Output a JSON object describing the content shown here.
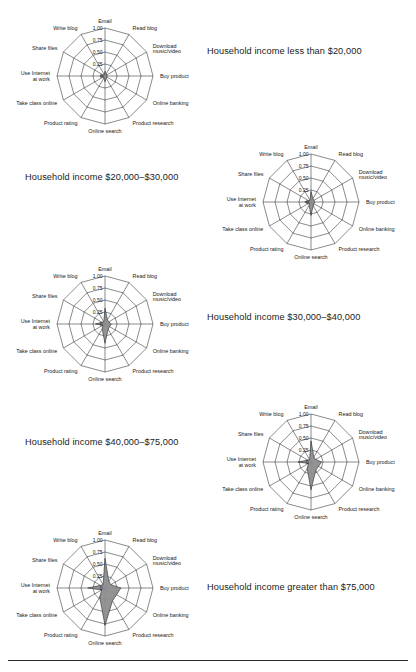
{
  "figure": {
    "title": "",
    "axes_labels": [
      "Email",
      "Read blog",
      "Download music/video",
      "Buy product",
      "Online banking",
      "Product research",
      "Online search",
      "Product rating",
      "Take class online",
      "Use Internet at work",
      "Share files",
      "Write blog"
    ],
    "tick_labels": [
      "1.00",
      "0.75",
      "0.50",
      "0.25",
      "0"
    ],
    "fill_color": "#8e8e8e",
    "line_color": "#2b2b2b",
    "panels": [
      {
        "caption": "Household income less than $20,000",
        "caption_side": "right",
        "values": [
          0.1,
          0.05,
          0.04,
          0.05,
          0.04,
          0.05,
          0.12,
          0.05,
          0.03,
          0.1,
          0.04,
          0.03
        ]
      },
      {
        "caption": "Household income $20,000–$30,000",
        "caption_side": "left",
        "values": [
          0.22,
          0.08,
          0.07,
          0.08,
          0.07,
          0.09,
          0.28,
          0.08,
          0.04,
          0.13,
          0.05,
          0.04
        ]
      },
      {
        "caption": "Household income $30,000–$40,000",
        "caption_side": "right",
        "values": [
          0.33,
          0.1,
          0.09,
          0.13,
          0.11,
          0.13,
          0.4,
          0.12,
          0.05,
          0.2,
          0.07,
          0.05
        ]
      },
      {
        "caption": "Household income $40,000–$75,000",
        "caption_side": "left",
        "values": [
          0.44,
          0.12,
          0.11,
          0.22,
          0.18,
          0.2,
          0.58,
          0.16,
          0.06,
          0.27,
          0.08,
          0.06
        ]
      },
      {
        "caption": "Household income greater than $75,000",
        "caption_side": "right",
        "values": [
          0.62,
          0.16,
          0.14,
          0.33,
          0.28,
          0.31,
          0.78,
          0.22,
          0.08,
          0.36,
          0.11,
          0.08
        ]
      }
    ]
  },
  "chart_data": {
    "type": "radar",
    "categories": [
      "Email",
      "Read blog",
      "Download music/video",
      "Buy product",
      "Online banking",
      "Product research",
      "Online search",
      "Product rating",
      "Take class online",
      "Use Internet at work",
      "Share files",
      "Write blog"
    ],
    "rlim": [
      0,
      1.0
    ],
    "rticks": [
      0,
      0.25,
      0.5,
      0.75,
      1.0
    ],
    "rtick_labels": [
      "0",
      "0.25",
      "0.50",
      "0.75",
      "1.00"
    ],
    "grid": true,
    "legend": "none",
    "series": [
      {
        "name": "Household income less than $20,000",
        "values": [
          0.1,
          0.05,
          0.04,
          0.05,
          0.04,
          0.05,
          0.12,
          0.05,
          0.03,
          0.1,
          0.04,
          0.03
        ]
      },
      {
        "name": "Household income $20,000–$30,000",
        "values": [
          0.22,
          0.08,
          0.07,
          0.08,
          0.07,
          0.09,
          0.28,
          0.08,
          0.04,
          0.13,
          0.05,
          0.04
        ]
      },
      {
        "name": "Household income $30,000–$40,000",
        "values": [
          0.33,
          0.1,
          0.09,
          0.13,
          0.11,
          0.13,
          0.4,
          0.12,
          0.05,
          0.2,
          0.07,
          0.05
        ]
      },
      {
        "name": "Household income $40,000–$75,000",
        "values": [
          0.44,
          0.12,
          0.11,
          0.22,
          0.18,
          0.2,
          0.58,
          0.16,
          0.06,
          0.27,
          0.08,
          0.06
        ]
      },
      {
        "name": "Household income greater than $75,000",
        "values": [
          0.62,
          0.16,
          0.14,
          0.33,
          0.28,
          0.31,
          0.78,
          0.22,
          0.08,
          0.36,
          0.11,
          0.08
        ]
      }
    ]
  },
  "layout": {
    "panel_positions": [
      {
        "x": 10,
        "y": 4,
        "cw": 190,
        "ch": 140,
        "cap_x": 207,
        "cap_y": 46
      },
      {
        "x": 216,
        "y": 130,
        "cw": 190,
        "ch": 140,
        "cap_x": 25,
        "cap_y": 172
      },
      {
        "x": 10,
        "y": 252,
        "cw": 190,
        "ch": 140,
        "cap_x": 207,
        "cap_y": 312
      },
      {
        "x": 216,
        "y": 390,
        "cw": 190,
        "ch": 140,
        "cap_x": 25,
        "cap_y": 437
      },
      {
        "x": 10,
        "y": 512,
        "cw": 190,
        "ch": 148,
        "cap_x": 207,
        "cap_y": 582
      }
    ]
  }
}
